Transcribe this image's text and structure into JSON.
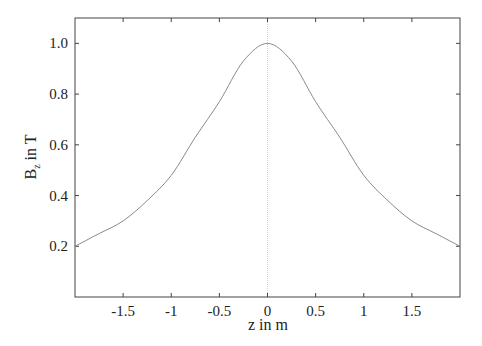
{
  "chart_data": {
    "type": "line",
    "title": "",
    "xlabel": "z in m",
    "ylabel": "B_z in T",
    "ylabel_main": "B",
    "ylabel_sub": "z",
    "ylabel_rest": " in T",
    "xlim": [
      -2.0,
      2.0
    ],
    "ylim": [
      0.0,
      1.1
    ],
    "grid": false,
    "legend": null,
    "x_ticks": [
      -1.5,
      -1,
      -0.5,
      0,
      0.5,
      1,
      1.5
    ],
    "x_tick_labels": [
      "-1.5",
      "-1",
      "-0.5",
      "0",
      "0.5",
      "1",
      "1.5"
    ],
    "y_ticks": [
      0.2,
      0.4,
      0.6,
      0.8,
      1.0
    ],
    "y_tick_labels": [
      "0.2",
      "0.4",
      "0.6",
      "0.8",
      "1.0"
    ],
    "annotations": [
      "vertical dotted line at z = 0"
    ],
    "series": [
      {
        "name": "B_z(z)",
        "color": "#8a8a8a",
        "x": [
          -2.0,
          -1.75,
          -1.5,
          -1.25,
          -1.0,
          -0.75,
          -0.5,
          -0.25,
          0.0,
          0.25,
          0.5,
          0.75,
          1.0,
          1.25,
          1.5,
          1.75,
          2.0
        ],
        "y": [
          0.2,
          0.25,
          0.3,
          0.38,
          0.48,
          0.63,
          0.77,
          0.93,
          1.0,
          0.93,
          0.77,
          0.63,
          0.48,
          0.38,
          0.3,
          0.25,
          0.2
        ]
      }
    ]
  },
  "colors": {
    "axis": "#444444",
    "curve": "#8a8a8a",
    "zero_line": "#d0d0d0"
  }
}
